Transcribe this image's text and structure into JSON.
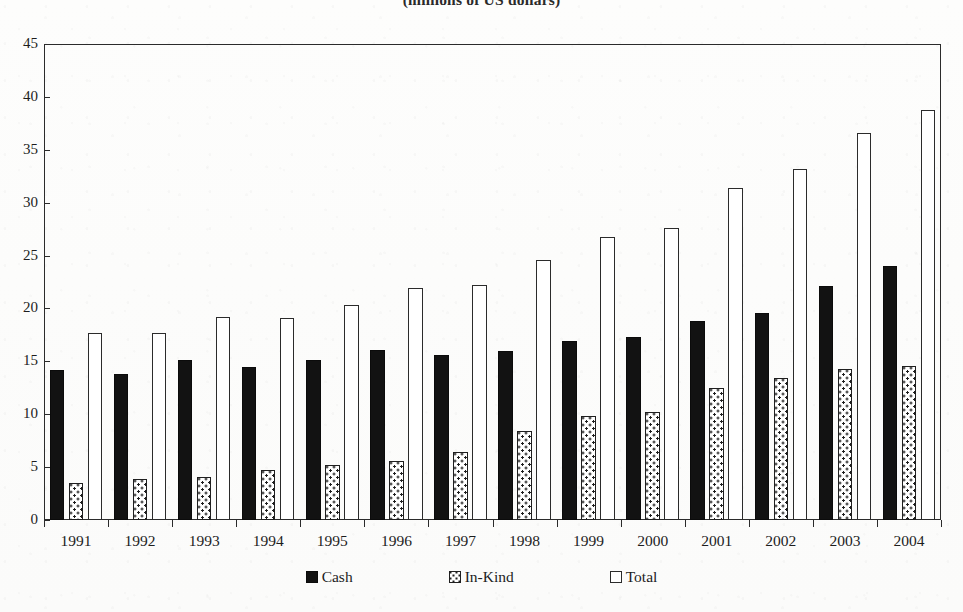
{
  "chart_data": {
    "type": "bar",
    "title": "(millions of US dollars)",
    "xlabel": "",
    "ylabel": "",
    "ylim": [
      0,
      45
    ],
    "ytick_step": 5,
    "yticks": [
      0,
      5,
      10,
      15,
      20,
      25,
      30,
      35,
      40,
      45
    ],
    "grid": false,
    "legend_position": "bottom",
    "categories": [
      "1991",
      "1992",
      "1993",
      "1994",
      "1995",
      "1996",
      "1997",
      "1998",
      "1999",
      "2000",
      "2001",
      "2002",
      "2003",
      "2004"
    ],
    "series": [
      {
        "name": "Cash",
        "style": "solid-black",
        "color": "#121212",
        "values": [
          14.2,
          13.8,
          15.1,
          14.5,
          15.1,
          16.1,
          15.6,
          16.0,
          16.9,
          17.3,
          18.8,
          19.6,
          22.1,
          24.0
        ]
      },
      {
        "name": "In-Kind",
        "style": "dotted-fill",
        "color": "#ffffff",
        "values": [
          3.5,
          3.9,
          4.1,
          4.7,
          5.2,
          5.6,
          6.4,
          8.4,
          9.8,
          10.2,
          12.5,
          13.4,
          14.3,
          14.6
        ]
      },
      {
        "name": "Total",
        "style": "open-white",
        "color": "#ffffff",
        "values": [
          17.7,
          17.7,
          19.2,
          19.1,
          20.3,
          21.9,
          22.2,
          24.6,
          26.8,
          27.6,
          31.4,
          33.2,
          36.6,
          38.8
        ]
      }
    ]
  },
  "legend": {
    "items": [
      {
        "label": "Cash",
        "swatch": "solid-black-swatch"
      },
      {
        "label": "In-Kind",
        "swatch": "dotted-swatch"
      },
      {
        "label": "Total",
        "swatch": "open-white-swatch"
      }
    ]
  },
  "colors": {
    "axis": "#2b2b2b",
    "cash": "#121212",
    "inkind_fill": "#ffffff",
    "inkind_dots": "#1f1f1f",
    "total_fill": "#ffffff",
    "text": "#1d1d1d",
    "paper": "#fdfdfc"
  }
}
